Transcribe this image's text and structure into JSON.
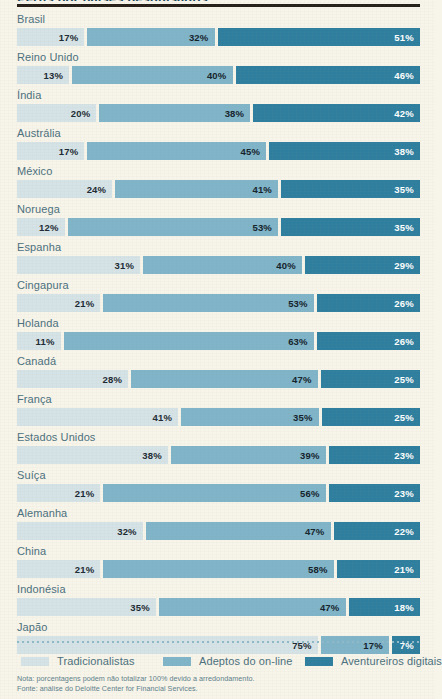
{
  "header": {
    "title_partial": "Perfis por países pesquisados",
    "rule_color": "#241f18"
  },
  "colors": {
    "background": "#f7f4ea",
    "traditionalists": "#d5e3e7",
    "online_adopters": "#7fb4c9",
    "digital_adventurers": "#2e7f9f",
    "label_text": "#4a707d",
    "note_text": "#5c7f8b"
  },
  "legend": {
    "items": [
      {
        "label": "Tradicionalistas",
        "color": "#d5e3e7"
      },
      {
        "label": "Adeptos do on-line",
        "color": "#7fb4c9"
      },
      {
        "label": "Aventureiros digitais",
        "color": "#2e7f9f"
      }
    ]
  },
  "notes": {
    "line1": "Nota: porcentagens podem não totalizar 100% devido a arredondamento.",
    "line2": "Fonte: análise do Deloitte Center for Financial Services."
  },
  "chart_data": {
    "type": "bar",
    "orientation": "horizontal",
    "stacked": true,
    "title": "Perfis por países pesquisados",
    "xlabel": "",
    "ylabel": "",
    "xlim": [
      0,
      100
    ],
    "grid": false,
    "legend_position": "bottom",
    "value_suffix": "%",
    "categories": [
      "Brasil",
      "Reino Unido",
      "Índia",
      "Austrália",
      "México",
      "Noruega",
      "Espanha",
      "Cingapura",
      "Holanda",
      "Canadá",
      "França",
      "Estados Unidos",
      "Suíça",
      "Alemanha",
      "China",
      "Indonésia",
      "Japão"
    ],
    "series": [
      {
        "name": "Tradicionalistas",
        "color": "#d5e3e7",
        "values": [
          17,
          13,
          20,
          17,
          24,
          12,
          31,
          21,
          11,
          28,
          41,
          38,
          21,
          32,
          21,
          35,
          75
        ]
      },
      {
        "name": "Adeptos do on-line",
        "color": "#7fb4c9",
        "values": [
          32,
          40,
          38,
          45,
          41,
          53,
          40,
          53,
          63,
          47,
          35,
          39,
          56,
          47,
          58,
          47,
          17
        ]
      },
      {
        "name": "Aventureiros digitais",
        "color": "#2e7f9f",
        "values": [
          51,
          46,
          42,
          38,
          35,
          35,
          29,
          26,
          26,
          25,
          25,
          23,
          23,
          22,
          21,
          18,
          7
        ]
      }
    ],
    "rows": [
      {
        "country": "Brasil",
        "traditionalists": "17%",
        "online": "32%",
        "adventurers": "51%"
      },
      {
        "country": "Reino Unido",
        "traditionalists": "13%",
        "online": "40%",
        "adventurers": "46%"
      },
      {
        "country": "Índia",
        "traditionalists": "20%",
        "online": "38%",
        "adventurers": "42%"
      },
      {
        "country": "Austrália",
        "traditionalists": "17%",
        "online": "45%",
        "adventurers": "38%"
      },
      {
        "country": "México",
        "traditionalists": "24%",
        "online": "41%",
        "adventurers": "35%"
      },
      {
        "country": "Noruega",
        "traditionalists": "12%",
        "online": "53%",
        "adventurers": "35%"
      },
      {
        "country": "Espanha",
        "traditionalists": "31%",
        "online": "40%",
        "adventurers": "29%"
      },
      {
        "country": "Cingapura",
        "traditionalists": "21%",
        "online": "53%",
        "adventurers": "26%"
      },
      {
        "country": "Holanda",
        "traditionalists": "11%",
        "online": "63%",
        "adventurers": "26%"
      },
      {
        "country": "Canadá",
        "traditionalists": "28%",
        "online": "47%",
        "adventurers": "25%"
      },
      {
        "country": "França",
        "traditionalists": "41%",
        "online": "35%",
        "adventurers": "25%"
      },
      {
        "country": "Estados Unidos",
        "traditionalists": "38%",
        "online": "39%",
        "adventurers": "23%"
      },
      {
        "country": "Suíça",
        "traditionalists": "21%",
        "online": "56%",
        "adventurers": "23%"
      },
      {
        "country": "Alemanha",
        "traditionalists": "32%",
        "online": "47%",
        "adventurers": "22%"
      },
      {
        "country": "China",
        "traditionalists": "21%",
        "online": "58%",
        "adventurers": "21%"
      },
      {
        "country": "Indonésia",
        "traditionalists": "35%",
        "online": "47%",
        "adventurers": "18%"
      },
      {
        "country": "Japão",
        "traditionalists": "75%",
        "online": "17%",
        "adventurers": "7%"
      }
    ]
  }
}
